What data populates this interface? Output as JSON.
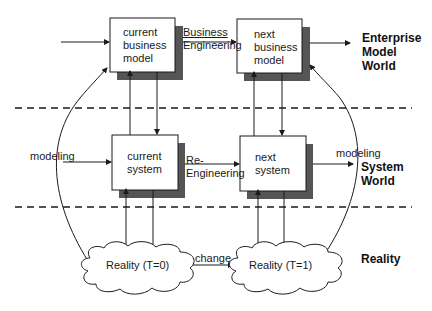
{
  "diagram": {
    "boxes": {
      "current_business_model": [
        "current",
        "business",
        "model"
      ],
      "next_business_model": [
        "next",
        "business",
        "model"
      ],
      "current_system": [
        "current",
        "system"
      ],
      "next_system": [
        "next",
        "system"
      ]
    },
    "clouds": {
      "reality_t0": "Reality (T=0)",
      "reality_t1": "Reality (T=1)"
    },
    "edge_labels": {
      "business_engineering": [
        "Business",
        "Engineering"
      ],
      "re_engineering": [
        "Re-",
        "Engineering"
      ],
      "modeling_left": "modeling",
      "modeling_right": "modeling",
      "change": "change"
    },
    "worlds": {
      "enterprise_model_world": [
        "Enterprise",
        "Model",
        "World"
      ],
      "system_world": [
        "System",
        "World"
      ],
      "reality": "Reality"
    },
    "colors": {
      "line": "#1a1a1a",
      "shadow": "#555555",
      "box_fill": "#ffffff"
    }
  }
}
